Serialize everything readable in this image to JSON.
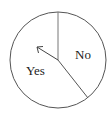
{
  "diagram": {
    "type": "spinner",
    "sections": [
      {
        "label": "Yes"
      },
      {
        "label": "No"
      }
    ],
    "arrow": "pointer-arrow",
    "colors": {
      "stroke": "#555555",
      "text": "#222222",
      "background": "#ffffff"
    }
  }
}
